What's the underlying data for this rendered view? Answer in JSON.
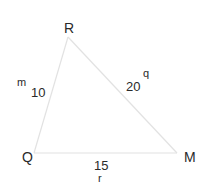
{
  "figure": {
    "type": "triangle",
    "vertices": [
      {
        "id": "R",
        "label": "R"
      },
      {
        "id": "Q",
        "label": "Q"
      },
      {
        "id": "M",
        "label": "M"
      }
    ],
    "sides": [
      {
        "between": [
          "Q",
          "R"
        ],
        "name": "m",
        "length": "10"
      },
      {
        "between": [
          "R",
          "M"
        ],
        "name": "q",
        "length": "20"
      },
      {
        "between": [
          "Q",
          "M"
        ],
        "name": "r",
        "length": "15"
      }
    ],
    "edge_color": "#e2e2e2",
    "text_color": "#2a2a2a"
  }
}
